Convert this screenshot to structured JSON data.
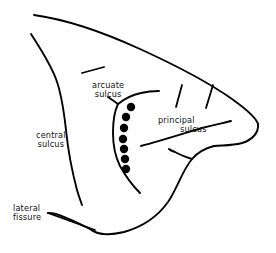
{
  "figure": {
    "background_color": "#ffffff",
    "ink_color": "#000000",
    "width": 276,
    "height": 253
  },
  "labels": {
    "arcuate": {
      "line1": "arcuate",
      "line2": "sulcus"
    },
    "central": {
      "line1": "central",
      "line2": "sulcus"
    },
    "principal": {
      "line1": "principal",
      "line2": "sulcus"
    },
    "lateral": {
      "line1": "lateral",
      "line2": "fissure"
    }
  },
  "anatomy": {
    "structures": [
      {
        "name": "cortical-outline",
        "kind": "outline"
      },
      {
        "name": "central-sulcus",
        "kind": "sulcus"
      },
      {
        "name": "arcuate-sulcus",
        "kind": "sulcus"
      },
      {
        "name": "principal-sulcus",
        "kind": "sulcus"
      },
      {
        "name": "lateral-fissure",
        "kind": "fissure"
      },
      {
        "name": "superior-tick-mark",
        "kind": "sulcus-fragment"
      },
      {
        "name": "posterior-tick-mark-1",
        "kind": "sulcus-fragment"
      },
      {
        "name": "posterior-tick-mark-2",
        "kind": "sulcus-fragment"
      }
    ]
  },
  "recording_sites": {
    "count": 7,
    "marker": "filled-circle",
    "color": "#000000",
    "points": [
      {
        "id": 1,
        "x": 131,
        "y": 107,
        "r": 4.2
      },
      {
        "id": 2,
        "x": 126,
        "y": 117,
        "r": 4.2
      },
      {
        "id": 3,
        "x": 124,
        "y": 128,
        "r": 4.2
      },
      {
        "id": 4,
        "x": 123,
        "y": 139,
        "r": 4.2
      },
      {
        "id": 5,
        "x": 124,
        "y": 149,
        "r": 4.2
      },
      {
        "id": 6,
        "x": 125,
        "y": 159,
        "r": 4.2
      },
      {
        "id": 7,
        "x": 126,
        "y": 169,
        "r": 4.2
      }
    ]
  }
}
